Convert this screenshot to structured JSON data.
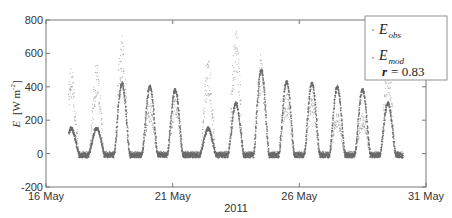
{
  "chart_data": {
    "type": "scatter",
    "title": "",
    "xlabel": "2011",
    "ylabel": "E [W m^-2]",
    "ylabel_parts": {
      "var": "E",
      "unit_open": "[W m",
      "exp": "-2",
      "unit_close": "]"
    },
    "xlim_days": [
      16,
      31
    ],
    "ylim": [
      -200,
      800
    ],
    "yticks": [
      -200,
      0,
      200,
      400,
      600,
      800
    ],
    "xticks": [
      {
        "day": 16,
        "label": "16 May"
      },
      {
        "day": 21,
        "label": "21 May"
      },
      {
        "day": 26,
        "label": "26 May"
      },
      {
        "day": 31,
        "label": "31 May"
      }
    ],
    "grid": false,
    "legend_position": "upper right",
    "legend": {
      "obs": {
        "label": "E",
        "sub": "obs"
      },
      "mod": {
        "label": "E",
        "sub": "mod"
      },
      "stat": {
        "label": "r",
        "value": "= 0.83"
      }
    },
    "series": [
      {
        "name": "E_obs",
        "marker": "dot",
        "color": "#8a8a8a",
        "daily_peaks": [
          {
            "day": 17.0,
            "peak": 420
          },
          {
            "day": 18.0,
            "peak": 430
          },
          {
            "day": 19.0,
            "peak": 570
          },
          {
            "day": 20.1,
            "peak": 250
          },
          {
            "day": 21.1,
            "peak": 280
          },
          {
            "day": 22.4,
            "peak": 460
          },
          {
            "day": 23.5,
            "peak": 610
          },
          {
            "day": 24.5,
            "peak": 480
          },
          {
            "day": 25.5,
            "peak": 300
          },
          {
            "day": 26.5,
            "peak": 300
          },
          {
            "day": 27.5,
            "peak": 200
          },
          {
            "day": 28.5,
            "peak": 200
          },
          {
            "day": 29.5,
            "peak": 470
          }
        ],
        "night_value": 0
      },
      {
        "name": "E_mod",
        "marker": "dot",
        "color": "#6a6a6a",
        "daily_peaks": [
          {
            "day": 17.0,
            "peak": 150
          },
          {
            "day": 18.0,
            "peak": 150
          },
          {
            "day": 19.0,
            "peak": 420
          },
          {
            "day": 20.1,
            "peak": 400
          },
          {
            "day": 21.1,
            "peak": 380
          },
          {
            "day": 22.4,
            "peak": 150
          },
          {
            "day": 23.5,
            "peak": 300
          },
          {
            "day": 24.5,
            "peak": 500
          },
          {
            "day": 25.5,
            "peak": 430
          },
          {
            "day": 26.5,
            "peak": 420
          },
          {
            "day": 27.5,
            "peak": 400
          },
          {
            "day": 28.5,
            "peak": 380
          },
          {
            "day": 29.5,
            "peak": 300
          }
        ],
        "night_value": -10
      }
    ],
    "statistics": {
      "r": 0.83
    }
  }
}
